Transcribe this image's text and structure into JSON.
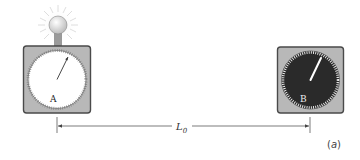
{
  "figure": {
    "panel_label": "(a)",
    "panel_letter": "a",
    "distance_label": "L",
    "distance_subscript": "0"
  },
  "clocks": [
    {
      "id": "A",
      "label": "A",
      "face_color": "#ffffff",
      "tick_color": "#666666",
      "hand_color": "#333333",
      "has_light": true
    },
    {
      "id": "B",
      "label": "B",
      "face_color": "#2a2a2a",
      "tick_color": "#ffffff",
      "hand_color": "#ffffff",
      "has_light": false
    }
  ],
  "colors": {
    "case": "#b5b5b5",
    "case_border": "#555555",
    "bulb": "#e8e8e8",
    "glow": "#dddddd",
    "line": "#444444"
  }
}
